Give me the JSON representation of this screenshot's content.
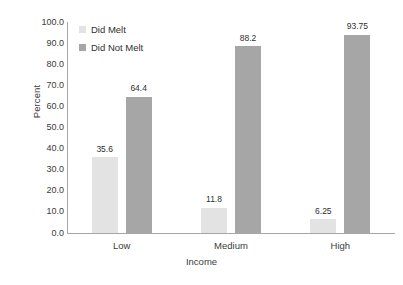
{
  "chart_data": {
    "type": "bar",
    "title": "",
    "xlabel": "Income",
    "ylabel": "Percent",
    "categories": [
      "Low",
      "Medium",
      "High"
    ],
    "series": [
      {
        "name": "Did Melt",
        "color": "#e3e3e3",
        "values": [
          35.6,
          11.8,
          6.25
        ],
        "labels": [
          "35.6",
          "11.8",
          "6.25"
        ]
      },
      {
        "name": "Did Not Melt",
        "color": "#a6a6a6",
        "values": [
          64.4,
          88.2,
          93.75
        ],
        "labels": [
          "64.4",
          "88.2",
          "93.75"
        ]
      }
    ],
    "ylim": [
      0,
      100
    ],
    "ytick_step": 10,
    "ytick_labels": [
      "100.0",
      "90.0",
      "80.0",
      "70.0",
      "60.0",
      "50.0",
      "40.0",
      "30.0",
      "20.0",
      "10.0",
      "0.0"
    ],
    "grid": false,
    "legend_position": "top-left-inside",
    "data_labels_shown": true
  },
  "legend": {
    "items": [
      {
        "label": "Did Melt",
        "color": "#e3e3e3"
      },
      {
        "label": "Did Not Melt",
        "color": "#a6a6a6"
      }
    ]
  },
  "axes": {
    "y_title": "Percent",
    "x_title": "Income",
    "axis_color": "#a6a6a6"
  }
}
